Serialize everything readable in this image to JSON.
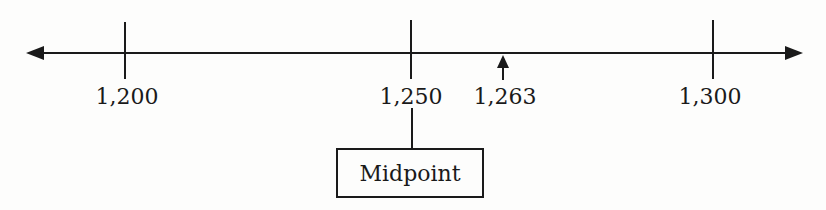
{
  "diagram": {
    "type": "number-line",
    "ticks": [
      {
        "value": 1200,
        "label": "1,200",
        "x": 125
      },
      {
        "value": 1250,
        "label": "1,250",
        "x": 411
      },
      {
        "value": 1300,
        "label": "1,300",
        "x": 713
      }
    ],
    "marker": {
      "value": 1263,
      "label": "1,263",
      "x": 503,
      "icon": "up-arrow-icon"
    },
    "callout": {
      "label": "Midpoint",
      "points_to": "1,250"
    },
    "colors": {
      "ink": "#1a1a1a",
      "background": "#fdfdfc"
    }
  }
}
